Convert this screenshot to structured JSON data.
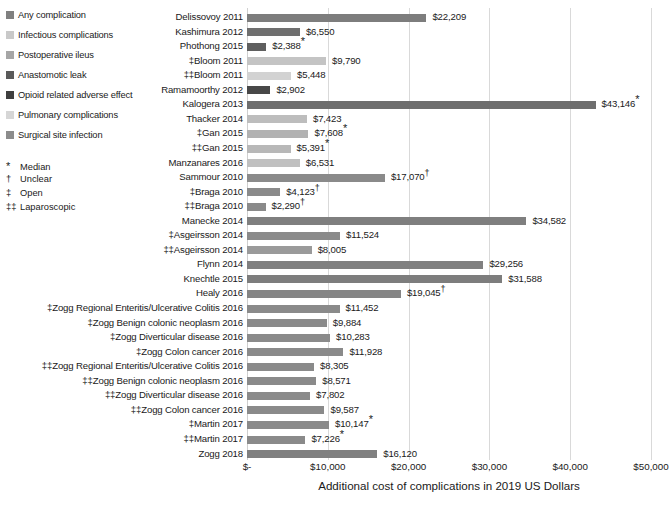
{
  "legend": {
    "items": [
      {
        "label": "Any complication",
        "color": "#808080"
      },
      {
        "label": "Infectious complications",
        "color": "#c9c9c9"
      },
      {
        "label": "Postoperative ileus",
        "color": "#a6a6a6"
      },
      {
        "label": "Anastomotic leak",
        "color": "#5a5a5a"
      },
      {
        "label": "Opioid related adverse effect",
        "color": "#3f3f3f"
      },
      {
        "label": "Pulmonary complications",
        "color": "#d6d6d6"
      },
      {
        "label": "Surgical site infection",
        "color": "#8c8c8c"
      }
    ]
  },
  "footnotes": [
    {
      "symbol": "*",
      "label": "Median"
    },
    {
      "symbol": "†",
      "label": "Unclear"
    },
    {
      "symbol": "‡",
      "label": "Open"
    },
    {
      "symbol": "‡‡",
      "label": "Laparoscopic"
    }
  ],
  "chart_data": {
    "type": "bar",
    "orientation": "horizontal",
    "title": "",
    "xlabel": "Additional cost of complications in 2019 US Dollars",
    "ylabel": "",
    "xlim": [
      0,
      50000
    ],
    "grid": true,
    "legend_position": "top-left",
    "xticks": [
      0,
      10000,
      20000,
      30000,
      40000,
      50000
    ],
    "xticklabels": [
      "$-",
      "$10,000",
      "$20,000",
      "$30,000",
      "$40,000",
      "$50,000"
    ],
    "categories": [
      "Delissovoy 2011",
      "Kashimura 2012",
      "Phothong 2015",
      "‡Bloom 2011",
      "‡‡Bloom 2011",
      "Ramamoorthy 2012",
      "Kalogera 2013",
      "Thacker 2014",
      "‡Gan 2015",
      "‡‡Gan 2015",
      "Manzanares 2016",
      "Sammour 2010",
      "‡Braga 2010",
      "‡‡Braga 2010",
      "Manecke 2014",
      "‡Asgeirsson 2014",
      "‡‡Asgeirsson 2014",
      "Flynn 2014",
      "Knechtle 2015",
      "Healy 2016",
      "‡Zogg Regional Enteritis/Ulcerative Colitis 2016",
      "‡Zogg Benign colonic neoplasm 2016",
      "‡Zogg Diverticular disease 2016",
      "‡Zogg Colon cancer 2016",
      "‡‡Zogg Regional Enteritis/Ulcerative Colitis 2016",
      "‡‡Zogg Benign colonic neoplasm 2016",
      "‡‡Zogg Diverticular disease 2016",
      "‡‡Zogg Colon cancer 2016",
      "‡Martin 2017",
      "‡‡Martin 2017",
      "Zogg 2018"
    ],
    "values": [
      22209,
      6550,
      2388,
      9790,
      5448,
      2902,
      43146,
      7423,
      7608,
      5391,
      6531,
      17070,
      4123,
      2290,
      34582,
      11524,
      8005,
      29256,
      31588,
      19045,
      11452,
      9884,
      10283,
      11928,
      8305,
      8571,
      7802,
      9587,
      10147,
      7226,
      16120
    ],
    "value_labels": [
      "$22,209",
      "$6,550",
      "$2,388",
      "$9,790",
      "$5,448",
      "$2,902",
      "$43,146",
      "$7,423",
      "$7,608",
      "$5,391",
      "$6,531",
      "$17,070",
      "$4,123",
      "$2,290",
      "$34,582",
      "$11,524",
      "$8,005",
      "$29,256",
      "$31,588",
      "$19,045",
      "$11,452",
      "$9,884",
      "$10,283",
      "$11,928",
      "$8,305",
      "$8,571",
      "$7,802",
      "$9,587",
      "$10,147",
      "$7,226",
      "$16,120"
    ],
    "value_marks": [
      "",
      "",
      "*",
      "",
      "",
      "",
      "*",
      "",
      "*",
      "*",
      "",
      "†",
      "†",
      "†",
      "",
      "",
      "",
      "",
      "",
      "†",
      "",
      "",
      "",
      "",
      "",
      "",
      "",
      "",
      "*",
      "*",
      ""
    ],
    "series_of_bar": [
      "Any complication",
      "Any complication",
      "Anastomotic leak",
      "Infectious complications",
      "Infectious complications",
      "Opioid related adverse effect",
      "Any complication",
      "Pulmonary complications",
      "Postoperative ileus",
      "Postoperative ileus",
      "Pulmonary complications",
      "Any complication",
      "Any complication",
      "Any complication",
      "Any complication",
      "Any complication",
      "Any complication",
      "Any complication",
      "Any complication",
      "Any complication",
      "Any complication",
      "Any complication",
      "Any complication",
      "Any complication",
      "Any complication",
      "Any complication",
      "Any complication",
      "Any complication",
      "Any complication",
      "Any complication",
      "Any complication"
    ],
    "bar_colors": [
      "#7d7d7d",
      "#6f6f6f",
      "#5f5f5f",
      "#c4c4c4",
      "#d2d2d2",
      "#484848",
      "#6e6e6e",
      "#bdbdbd",
      "#b2b2b2",
      "#b8b8b8",
      "#c0c0c0",
      "#8a8a8a",
      "#8a8a8a",
      "#8a8a8a",
      "#7f7f7f",
      "#8a8a8a",
      "#9a9a9a",
      "#808080",
      "#7d7d7d",
      "#858585",
      "#8a8a8a",
      "#8a8a8a",
      "#8a8a8a",
      "#8a8a8a",
      "#8a8a8a",
      "#8a8a8a",
      "#8a8a8a",
      "#8a8a8a",
      "#8a8a8a",
      "#8a8a8a",
      "#808080"
    ]
  }
}
